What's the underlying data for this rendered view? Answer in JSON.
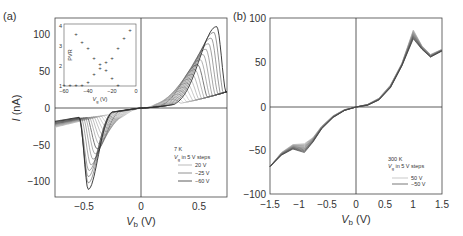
{
  "chart_data": [
    {
      "panel_label": "(a)",
      "type": "line",
      "title": "",
      "xlabel": "V_b (V)",
      "ylabel": "I (nA)",
      "xlim": [
        -0.75,
        0.75
      ],
      "ylim": [
        -120,
        120
      ],
      "xticks": [
        "-0.5",
        "0",
        "0.5"
      ],
      "yticks": [
        "-100",
        "-50",
        "0",
        "50",
        "100"
      ],
      "annotation": {
        "temp": "7 K",
        "step_note": "V_g in 5 V steps"
      },
      "legend": [
        "20 V",
        "-25 V",
        "-60 V"
      ],
      "series_description": "Family of I-V curves for V_g from 20 V to -60 V in 5 V steps; NDR peaks at positive bias up to ~110 nA near 0.65 V, valleys at negative bias down to ~-110 nA near -0.45 V",
      "series": [
        {
          "name": "20 V",
          "peak_pos": [
            0.7,
            20
          ],
          "peak_neg": [
            -0.75,
            -20
          ]
        },
        {
          "name": "-25 V",
          "peak_pos": [
            0.3,
            30
          ],
          "peak_neg": [
            -0.28,
            -25
          ]
        },
        {
          "name": "-60 V",
          "peak_pos": [
            0.65,
            110
          ],
          "peak_neg": [
            -0.45,
            -110
          ]
        }
      ],
      "inset": {
        "type": "scatter",
        "xlabel": "V_g (V)",
        "ylabel": "PVR",
        "xlim": [
          -60,
          0
        ],
        "ylim": [
          1,
          4
        ],
        "xticks": [
          "-60",
          "-40",
          "-20",
          "0"
        ],
        "yticks": [
          "1",
          "2",
          "3",
          "4"
        ],
        "points": [
          [
            -60,
            1.05
          ],
          [
            -55,
            1.05
          ],
          [
            -50,
            1.05
          ],
          [
            -45,
            1.05
          ],
          [
            -40,
            1.2
          ],
          [
            -35,
            1.6
          ],
          [
            -30,
            1.9
          ],
          [
            -25,
            1.8
          ],
          [
            -20,
            1.4
          ],
          [
            -15,
            1.05
          ],
          [
            -50,
            3.6
          ],
          [
            -45,
            3.2
          ],
          [
            -40,
            2.9
          ],
          [
            -35,
            2.4
          ],
          [
            -30,
            2.1
          ],
          [
            -25,
            2.2
          ],
          [
            -20,
            2.4
          ],
          [
            -15,
            2.9
          ],
          [
            -10,
            3.4
          ],
          [
            -5,
            3.8
          ]
        ]
      }
    },
    {
      "panel_label": "(b)",
      "type": "line",
      "title": "",
      "xlabel": "V_b (V)",
      "ylabel": "",
      "xlim": [
        -1.5,
        1.5
      ],
      "ylim": [
        -100,
        100
      ],
      "xticks": [
        "-1.5",
        "-1",
        "-0.5",
        "0",
        "0.5",
        "1",
        "1.5"
      ],
      "yticks": [
        "-100",
        "-50",
        "0",
        "50",
        "100"
      ],
      "annotation": {
        "temp": "300 K",
        "step_note": "V_g in 5 V steps"
      },
      "legend": [
        "50 V",
        "-50 V"
      ],
      "series_description": "Family of I-V curves at 300 K; peak ~85 nA near 1.0 V, valley ~55 nA near 1.25 V, shoulder ~-45 nA near -0.9 V, -68 nA at -1.5 V",
      "series": [
        {
          "name": "50 V",
          "points": [
            [
              -1.5,
              -68
            ],
            [
              -1.3,
              -52
            ],
            [
              -1.1,
              -43
            ],
            [
              -0.9,
              -42
            ],
            [
              -0.75,
              -35
            ],
            [
              -0.6,
              -22
            ],
            [
              -0.4,
              -10
            ],
            [
              -0.2,
              -3
            ],
            [
              0,
              0
            ],
            [
              0.2,
              3
            ],
            [
              0.4,
              10
            ],
            [
              0.6,
              25
            ],
            [
              0.8,
              50
            ],
            [
              1.0,
              88
            ],
            [
              1.15,
              70
            ],
            [
              1.3,
              60
            ],
            [
              1.5,
              66
            ]
          ]
        },
        {
          "name": "-50 V",
          "points": [
            [
              -1.5,
              -68
            ],
            [
              -1.3,
              -55
            ],
            [
              -1.1,
              -48
            ],
            [
              -0.9,
              -52
            ],
            [
              -0.75,
              -40
            ],
            [
              -0.6,
              -25
            ],
            [
              -0.4,
              -12
            ],
            [
              -0.2,
              -4
            ],
            [
              0,
              0
            ],
            [
              0.2,
              2
            ],
            [
              0.4,
              8
            ],
            [
              0.6,
              22
            ],
            [
              0.8,
              47
            ],
            [
              1.0,
              78
            ],
            [
              1.15,
              66
            ],
            [
              1.3,
              57
            ],
            [
              1.5,
              64
            ]
          ]
        }
      ]
    }
  ],
  "labels": {
    "panel_a": "(a)",
    "panel_b": "(b)",
    "a_ylabel_italic": "I",
    "a_ylabel_unit": " (nA)",
    "xlabel_italic": "V",
    "xlabel_sub": "b",
    "xlabel_unit": " (V)",
    "a_temp": "7 K",
    "a_step_v": "V",
    "a_step_sub": "g",
    "a_step_rest": " in 5 V steps",
    "a_leg1": "20 V",
    "a_leg2": "−25 V",
    "a_leg3": "−60 V",
    "b_temp": "300 K",
    "b_step_v": "V",
    "b_step_sub": "g",
    "b_step_rest": " in 5 V steps",
    "b_leg1": "50 V",
    "b_leg2": "−50 V",
    "inset_ylabel": "PVR",
    "inset_xlabel_v": "V",
    "inset_xlabel_sub": "g",
    "inset_xlabel_unit": " (V)",
    "a_xticks": [
      "−0.5",
      "0",
      "0.5"
    ],
    "a_yticks": [
      "100",
      "50",
      "0",
      "−50",
      "−100"
    ],
    "b_xticks": [
      "−1.5",
      "−1",
      "−0.5",
      "0",
      "0.5",
      "1",
      "1.5"
    ],
    "b_yticks": [
      "100",
      "50",
      "0",
      "−50",
      "−100"
    ],
    "inset_xticks": [
      "−60",
      "−40",
      "−20",
      "0"
    ],
    "inset_yticks": [
      "4",
      "3",
      "2",
      "1"
    ]
  }
}
